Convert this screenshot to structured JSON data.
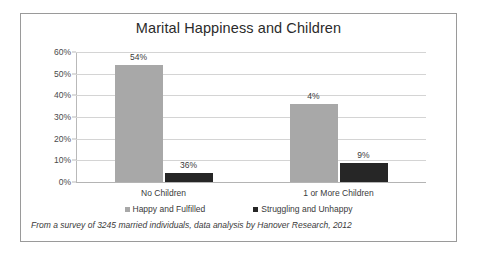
{
  "chart_data": {
    "type": "bar",
    "title": "Marital Happiness and Children",
    "categories": [
      "No Children",
      "1 or More Children"
    ],
    "series": [
      {
        "name": "Happy and Fulfilled",
        "values": [
          54,
          36
        ],
        "color": "#a8a8a8"
      },
      {
        "name": "Struggling and Unhappy",
        "values": [
          4,
          9
        ],
        "color": "#262626"
      }
    ],
    "value_labels": [
      [
        "54%",
        "4%"
      ],
      [
        "36%",
        "9%"
      ]
    ],
    "xlabel": "",
    "ylabel": "",
    "ylim": [
      0,
      60
    ],
    "ytick_labels": [
      "60%",
      "50%",
      "40%",
      "30%",
      "20%",
      "10%",
      "0%"
    ],
    "ytick_values": [
      60,
      50,
      40,
      30,
      20,
      10,
      0
    ],
    "grid": true,
    "legend_position": "bottom",
    "footnote": "From a survey of 3245 married individuals, data analysis by Hanover Research, 2012"
  }
}
